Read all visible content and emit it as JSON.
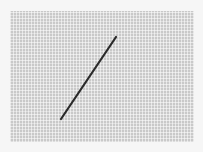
{
  "image": {
    "description": "Photograph of a thin dark needle lying diagonally on a gray woven mesh fabric",
    "background_color": "#f6f6f6",
    "mesh_color": "#c9c9c9",
    "needle": {
      "color": "#2a2a2a",
      "start": [
        116,
        37
      ],
      "end": [
        61,
        119
      ],
      "width": 2
    }
  }
}
